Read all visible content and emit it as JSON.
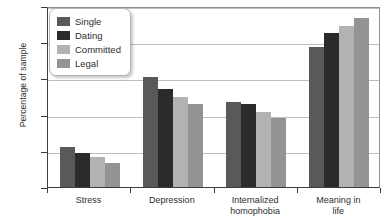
{
  "chart_data": {
    "type": "bar",
    "title": "",
    "xlabel": "",
    "ylabel": "Percentage of sample",
    "ylim": [
      5,
      30
    ],
    "yticks": [
      5,
      10,
      15,
      20,
      25,
      30
    ],
    "grid": true,
    "legend_position": "top-left",
    "categories": [
      "Stress",
      "Depression",
      "Internalized homophobia",
      "Meaning in life"
    ],
    "category_lines": [
      [
        "Stress"
      ],
      [
        "Depression"
      ],
      [
        "Internalized",
        "homophobia"
      ],
      [
        "Meaning in",
        "life"
      ]
    ],
    "series": [
      {
        "name": "Single",
        "color": "#595959",
        "values": [
          10.5,
          20.2,
          16.7,
          24.4
        ]
      },
      {
        "name": "Dating",
        "color": "#2b2b2b",
        "values": [
          9.7,
          18.5,
          16.4,
          26.3
        ]
      },
      {
        "name": "Committed",
        "color": "#b2b2b2",
        "values": [
          9.2,
          17.5,
          15.4,
          27.2
        ]
      },
      {
        "name": "Legal",
        "color": "#949494",
        "values": [
          8.3,
          16.4,
          14.5,
          28.4
        ]
      }
    ]
  },
  "axis": {
    "y_title": "Percentage of sample"
  }
}
